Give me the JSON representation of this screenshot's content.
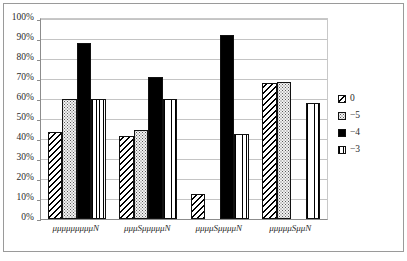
{
  "chart_data": {
    "type": "bar",
    "title": "",
    "xlabel": "",
    "ylabel": "",
    "ylim": [
      0,
      100
    ],
    "y_tick_step": 10,
    "grid": "horizontal",
    "legend_position": "right",
    "y_ticks": [
      "0%",
      "10%",
      "20%",
      "30%",
      "40%",
      "50%",
      "60%",
      "70%",
      "80%",
      "90%",
      "100%"
    ],
    "categories": [
      "μμμμμμμμμN",
      "μμμSμμμμμN",
      "μμμμSμμμμN",
      "μμμμμSμμN"
    ],
    "series": [
      {
        "name": "0",
        "pattern": "diagonal-hatch",
        "values": [
          43.5,
          41.5,
          12.5,
          68.0
        ]
      },
      {
        "name": "−5",
        "pattern": "dotted",
        "values": [
          60.0,
          44.5,
          null,
          68.5
        ]
      },
      {
        "name": "−4",
        "pattern": "solid-black",
        "values": [
          88.0,
          71.0,
          92.0,
          null
        ]
      },
      {
        "name": "−3",
        "pattern": "vertical-lines",
        "values": [
          60.0,
          60.0,
          42.5,
          58.0
        ]
      }
    ]
  }
}
